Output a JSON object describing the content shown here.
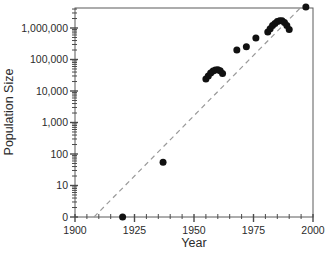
{
  "chart_data": {
    "type": "scatter",
    "title": "",
    "xlabel": "Year",
    "ylabel": "Population Size",
    "grid": false,
    "legend": "none",
    "x_axis": {
      "min": 1900,
      "max": 2000,
      "major_ticks": [
        1900,
        1925,
        1950,
        1975,
        2000
      ],
      "tick_labels": [
        "1900",
        "1925",
        "1950",
        "1975",
        "2000"
      ],
      "minor_tick_interval": 5
    },
    "y_axis": {
      "scale": "log-with-zero-break",
      "tick_values": [
        0,
        10,
        100,
        1000,
        10000,
        100000,
        1000000
      ],
      "tick_labels": [
        "0",
        "10",
        "100",
        "1,000",
        "10,000",
        "100,000",
        "1,000,000"
      ],
      "minor_ticks": "log-2-through-9-each-decade",
      "top_value": 4300000
    },
    "series": [
      {
        "name": "population",
        "marker": "filled-circle",
        "color": "#111111",
        "points": [
          {
            "year": 1920,
            "value": 0
          },
          {
            "year": 1937,
            "value": 55
          },
          {
            "year": 1955,
            "value": 24000
          },
          {
            "year": 1956,
            "value": 30000
          },
          {
            "year": 1957,
            "value": 37000
          },
          {
            "year": 1958,
            "value": 43000
          },
          {
            "year": 1959,
            "value": 46000
          },
          {
            "year": 1960,
            "value": 47000
          },
          {
            "year": 1961,
            "value": 44000
          },
          {
            "year": 1962,
            "value": 36000
          },
          {
            "year": 1968,
            "value": 200000
          },
          {
            "year": 1972,
            "value": 255000
          },
          {
            "year": 1976,
            "value": 480000
          },
          {
            "year": 1981,
            "value": 750000
          },
          {
            "year": 1982,
            "value": 950000
          },
          {
            "year": 1983,
            "value": 1200000
          },
          {
            "year": 1984,
            "value": 1400000
          },
          {
            "year": 1985,
            "value": 1600000
          },
          {
            "year": 1986,
            "value": 1700000
          },
          {
            "year": 1987,
            "value": 1700000
          },
          {
            "year": 1988,
            "value": 1500000
          },
          {
            "year": 1989,
            "value": 1200000
          },
          {
            "year": 1990,
            "value": 900000
          },
          {
            "year": 1997,
            "value": 4600000
          }
        ]
      }
    ],
    "reference_line": {
      "style": "dashed",
      "color": "#9a9a9a",
      "from": {
        "year": 1908,
        "value": 0
      },
      "to": {
        "year": 1995,
        "value": 4600000
      }
    },
    "style": {
      "point_color": "#111111",
      "point_radius": 3.5,
      "frame_color": "#5a5a5a",
      "tick_color": "#4a4a4a",
      "text_color": "#2b2b2b",
      "background": "#ffffff"
    }
  }
}
